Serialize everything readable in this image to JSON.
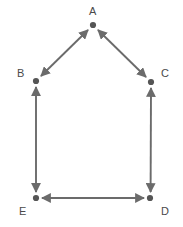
{
  "figure": {
    "title": "",
    "background_color": "#ffffff",
    "width": 183,
    "height": 227
  },
  "graph_data": {
    "type": "diagram",
    "diagram_kind": "undirected-graph",
    "edge_style": "double-headed-arrow",
    "node_color": "#555555",
    "edge_color": "#6b6b6b",
    "label_color": "#4a4a4a",
    "node_radius": 3,
    "nodes": [
      {
        "id": "A",
        "label": "A",
        "x": 93,
        "y": 25,
        "label_x": 89,
        "label_y": 6
      },
      {
        "id": "B",
        "label": "B",
        "x": 36,
        "y": 81,
        "label_x": 17,
        "label_y": 68
      },
      {
        "id": "C",
        "label": "C",
        "x": 151,
        "y": 82,
        "label_x": 161,
        "label_y": 68
      },
      {
        "id": "D",
        "label": "D",
        "x": 150,
        "y": 198,
        "label_x": 161,
        "label_y": 206
      },
      {
        "id": "E",
        "label": "E",
        "x": 36,
        "y": 198,
        "label_x": 19,
        "label_y": 206
      }
    ],
    "edges": [
      {
        "from": "A",
        "to": "B",
        "directed": "both"
      },
      {
        "from": "A",
        "to": "C",
        "directed": "both"
      },
      {
        "from": "B",
        "to": "E",
        "directed": "both"
      },
      {
        "from": "C",
        "to": "D",
        "directed": "both"
      },
      {
        "from": "E",
        "to": "D",
        "directed": "both"
      }
    ]
  }
}
